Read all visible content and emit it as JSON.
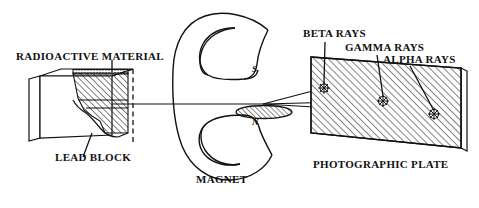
{
  "diagram": {
    "labels": {
      "radioactive_material": "RADIOACTIVE MATERIAL",
      "lead_block": "LEAD BLOCK",
      "magnet": "MAGNET",
      "photographic_plate": "PHOTOGRAPHIC PLATE",
      "beta_rays": "BETA RAYS",
      "gamma_rays": "GAMMA RAYS",
      "alpha_rays": "ALPHA RAYS",
      "pole_south": "S",
      "pole_north": "N"
    },
    "colors": {
      "ink": "#111111",
      "background": "#ffffff",
      "hatch": "#1a1a1a"
    },
    "elements": {
      "lead_block": {
        "name": "lead-block",
        "description": "cut-away 3D lead block with hatched interior and collimating channel",
        "cutaway_edge": "dashed"
      },
      "magnet": {
        "name": "horseshoe-magnet",
        "shape": "C-shaped, opening toward the right",
        "pole_top": "S",
        "pole_bottom": "N",
        "gap_face": "hatched ellipse on north pole"
      },
      "photographic_plate": {
        "name": "photographic-plate",
        "shape": "hatched quadrilateral shown in perspective with thin right edge",
        "impact_marks": 3
      },
      "rays": [
        {
          "name": "beta-rays",
          "deflection": "upward",
          "impact_x": 324,
          "impact_y": 88
        },
        {
          "name": "gamma-rays",
          "deflection": "undeflected (straight)",
          "impact_x": 383,
          "impact_y": 101
        },
        {
          "name": "alpha-rays",
          "deflection": "downward",
          "impact_x": 434,
          "impact_y": 114
        }
      ]
    }
  }
}
